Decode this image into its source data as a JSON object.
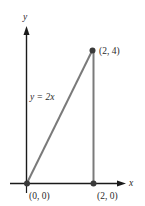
{
  "figure": {
    "type": "triangle-region-diagram",
    "axes": {
      "x_label": "x",
      "y_label": "y"
    },
    "line": {
      "equation_label": "y = 2x",
      "from": [
        0,
        0
      ],
      "to": [
        2,
        4
      ]
    },
    "points": [
      {
        "label": "(0, 0)",
        "x": 0,
        "y": 0
      },
      {
        "label": "(2, 0)",
        "x": 2,
        "y": 0
      },
      {
        "label": "(2, 4)",
        "x": 2,
        "y": 4
      }
    ],
    "colors": {
      "axis": "#1a1a1a",
      "line": "#7a7a7a",
      "point": "#3a3a3a",
      "text": "#2a2a2a",
      "background": "#ffffff"
    }
  }
}
